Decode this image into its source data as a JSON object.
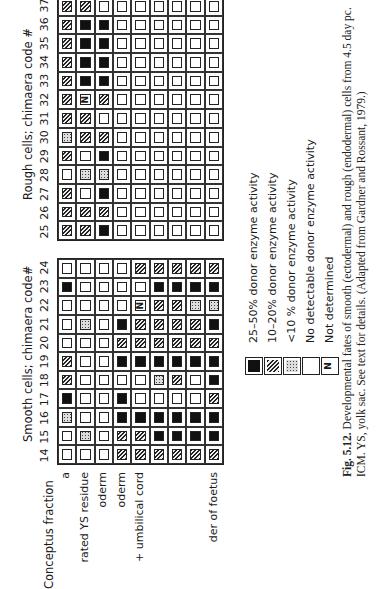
{
  "figure": {
    "header_label": "Conceptus fraction",
    "row_labels": [
      "a",
      "rated YS residue",
      "oderm",
      "oderm",
      "+ umbilical cord",
      "",
      "",
      "",
      "der of foetus"
    ],
    "smooth_title": "Smooth cells; chimaera code#",
    "rough_title": "Rough cells; chimaera code #",
    "smooth_codes": [
      "14",
      "15",
      "16",
      "17",
      "18",
      "19",
      "20",
      "21",
      "22",
      "23",
      "24"
    ],
    "rough_codes": [
      "25",
      "26",
      "27",
      "28",
      "29",
      "30",
      "31",
      "32",
      "33",
      "34",
      "35",
      "36",
      "37"
    ],
    "legend": [
      {
        "symbol": "B",
        "label": "25–50%  donor enzyme activity"
      },
      {
        "symbol": "H",
        "label": "10–20%  donor enzyme activity"
      },
      {
        "symbol": "D",
        "label": "<10 %   donor enzyme activity"
      },
      {
        "symbol": "E",
        "label": "No detectable donor enzyme activity"
      },
      {
        "symbol": "N",
        "label": "Not determined"
      }
    ],
    "caption_bold": "Fig. 5.12.",
    "caption_line1": " Developmental fates of smooth (ectodermal) and rough (endodermal) cells from 4.5 day pc.",
    "caption_line2": "ICM. YS, yolk sac. See text for details. (Adapted from Gardner and Rossant, 1979.)"
  },
  "chart_data": {
    "type": "table",
    "legend": {
      "B": "25-50% donor enzyme activity",
      "H": "10-20% donor enzyme activity",
      "D": "<10% donor enzyme activity",
      "E": "No detectable donor enzyme activity",
      "N": "Not determined"
    },
    "rows": [
      "Placenta (partially visible: 'a')",
      "Separated YS residue",
      "YS endoderm (partially visible)",
      "YS mesoderm (partially visible)",
      "Amnion + umbilical cord (partially visible)",
      "(unlabeled)",
      "(unlabeled)",
      "(unlabeled)",
      "Remainder of foetus"
    ],
    "columns_smooth": [
      "14",
      "15",
      "16",
      "17",
      "18",
      "19",
      "20",
      "21",
      "22",
      "23",
      "24"
    ],
    "columns_rough": [
      "25",
      "26",
      "27",
      "28",
      "29",
      "30",
      "31",
      "32",
      "33",
      "34",
      "35",
      "36",
      "37"
    ],
    "smooth": {
      "14": [
        "E",
        "E",
        "E",
        "H",
        "H",
        "H",
        "H",
        "H",
        "H"
      ],
      "15": [
        "E",
        "D",
        "E",
        "H",
        "H",
        "B",
        "B",
        "B",
        "B"
      ],
      "16": [
        "D",
        "E",
        "E",
        "B",
        "B",
        "B",
        "B",
        "B",
        "B"
      ],
      "17": [
        "B",
        "E",
        "E",
        "B",
        "E",
        "E",
        "E",
        "E",
        "H"
      ],
      "18": [
        "H",
        "E",
        "E",
        "E",
        "E",
        "D",
        "H",
        "E",
        "B"
      ],
      "19": [
        "H",
        "E",
        "E",
        "B",
        "B",
        "B",
        "B",
        "B",
        "B"
      ],
      "20": [
        "E",
        "E",
        "E",
        "H",
        "H",
        "H",
        "H",
        "H",
        "H"
      ],
      "21": [
        "E",
        "D",
        "E",
        "B",
        "H",
        "H",
        "H",
        "H",
        "B"
      ],
      "22": [
        "E",
        "E",
        "E",
        "E",
        "N",
        "H",
        "H",
        "D",
        "D"
      ],
      "23": [
        "B",
        "E",
        "E",
        "E",
        "E",
        "B",
        "B",
        "B",
        "B"
      ],
      "24": [
        "E",
        "E",
        "E",
        "E",
        "H",
        "H",
        "H",
        "H",
        "H"
      ]
    },
    "rough": {
      "25": [
        "H",
        "H",
        "B",
        "E",
        "E",
        "E",
        "E",
        "E",
        "E"
      ],
      "26": [
        "H",
        "H",
        "H",
        "E",
        "E",
        "E",
        "E",
        "E",
        "E"
      ],
      "27": [
        "H",
        "E",
        "B",
        "E",
        "E",
        "E",
        "E",
        "E",
        "E"
      ],
      "28": [
        "E",
        "D",
        "D",
        "E",
        "E",
        "E",
        "E",
        "E",
        "E"
      ],
      "29": [
        "H",
        "E",
        "B",
        "E",
        "E",
        "E",
        "E",
        "E",
        "E"
      ],
      "30": [
        "D",
        "H",
        "H",
        "E",
        "E",
        "E",
        "E",
        "E",
        "E"
      ],
      "31": [
        "H",
        "H",
        "E",
        "E",
        "E",
        "E",
        "E",
        "E",
        "E"
      ],
      "32": [
        "H",
        "N",
        "H",
        "E",
        "E",
        "E",
        "E",
        "E",
        "E"
      ],
      "33": [
        "H",
        "B",
        "B",
        "E",
        "E",
        "E",
        "E",
        "E",
        "E"
      ],
      "34": [
        "H",
        "B",
        "B",
        "E",
        "E",
        "E",
        "E",
        "E",
        "E"
      ],
      "35": [
        "H",
        "B",
        "B",
        "E",
        "E",
        "E",
        "E",
        "E",
        "E"
      ],
      "36": [
        "H",
        "B",
        "B",
        "E",
        "E",
        "E",
        "E",
        "E",
        "E"
      ],
      "37": [
        "H",
        "H",
        "E",
        "E",
        "E",
        "E",
        "E",
        "E",
        "E"
      ]
    }
  }
}
